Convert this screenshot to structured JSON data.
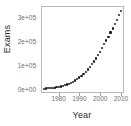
{
  "chart_data": {
    "type": "scatter",
    "title": "",
    "subtitle": "",
    "xlabel": "Year",
    "ylabel": "Exams",
    "xlim": [
      1972,
      2011
    ],
    "ylim": [
      -8000,
      345000
    ],
    "grid": false,
    "legend": null,
    "legend_position": "none",
    "marker": "filled-circle",
    "marker_color": "#1c1c1c",
    "xticks": [
      1980,
      1990,
      2000,
      2010
    ],
    "xtick_labels": [
      "1980",
      "1990",
      "2000",
      "2010"
    ],
    "yticks": [
      0,
      100000,
      200000,
      300000
    ],
    "ytick_labels": [
      "0e+00",
      "1e+05",
      "2e+05",
      "3e+05"
    ],
    "annotations": [],
    "x": [
      1973,
      1974,
      1975,
      1976,
      1977,
      1978,
      1979,
      1980,
      1981,
      1982,
      1983,
      1984,
      1985,
      1986,
      1987,
      1988,
      1989,
      1990,
      1991,
      1992,
      1993,
      1994,
      1995,
      1996,
      1997,
      1998,
      1999,
      2000,
      2001,
      2002,
      2003,
      2004,
      2005,
      2006,
      2007,
      2008,
      2009,
      2010
    ],
    "values": [
      6000,
      6500,
      7200,
      8000,
      9000,
      10200,
      11600,
      13200,
      15200,
      17500,
      20000,
      23000,
      26500,
      30500,
      35000,
      40000,
      45500,
      52000,
      59000,
      67000,
      76000,
      85500,
      96000,
      107000,
      119000,
      131500,
      145000,
      159000,
      174000,
      190000,
      206000,
      222000,
      239000,
      256000,
      274000,
      292000,
      311000,
      330000
    ]
  }
}
